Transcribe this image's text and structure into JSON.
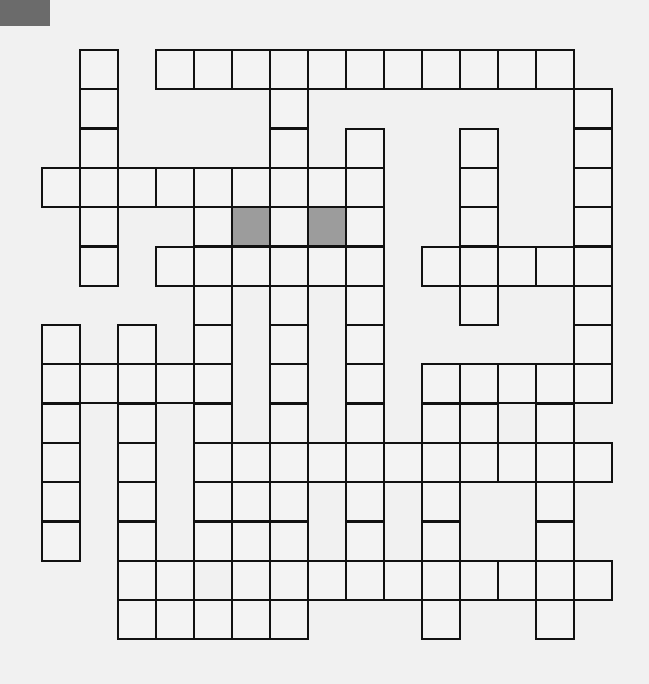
{
  "puzzle": {
    "type": "crossword",
    "cols": 15,
    "rows": 15,
    "origin_x": 42,
    "origin_y": 50,
    "cell_w": 38,
    "cell_h": 39.3,
    "colors": {
      "line": "#111111",
      "cell": "#f3f3f3",
      "shaded": "#9c9c9c",
      "page": "#f1f1f1",
      "corner_tab": "#6b6b6b"
    },
    "rows_cells": [
      [
        1,
        3,
        4,
        5,
        6,
        7,
        8,
        9,
        10,
        11,
        12,
        13
      ],
      [
        1,
        6,
        14
      ],
      [
        1,
        6,
        8,
        11,
        14
      ],
      [
        0,
        1,
        2,
        3,
        4,
        5,
        6,
        7,
        8,
        11,
        14
      ],
      [
        1,
        4,
        5,
        6,
        7,
        8,
        11,
        14
      ],
      [
        1,
        3,
        4,
        5,
        6,
        7,
        8,
        10,
        11,
        12,
        13,
        14
      ],
      [
        4,
        6,
        8,
        11,
        14
      ],
      [
        0,
        2,
        4,
        6,
        8,
        14
      ],
      [
        0,
        1,
        2,
        3,
        4,
        6,
        8,
        10,
        11,
        12,
        13,
        14
      ],
      [
        0,
        2,
        4,
        6,
        8,
        10,
        11,
        13
      ],
      [
        0,
        2,
        4,
        5,
        6,
        7,
        8,
        9,
        10,
        11,
        12,
        13,
        14
      ],
      [
        0,
        2,
        4,
        5,
        6,
        8,
        10,
        13
      ],
      [
        0,
        2,
        4,
        5,
        6,
        8,
        10,
        13
      ],
      [
        2,
        3,
        5,
        6,
        7,
        8,
        9,
        10,
        11,
        12,
        13,
        14
      ],
      [
        2,
        3,
        4,
        5,
        6,
        10,
        13
      ]
    ],
    "shaded_cells": [
      [
        4,
        5
      ],
      [
        4,
        7
      ]
    ]
  }
}
